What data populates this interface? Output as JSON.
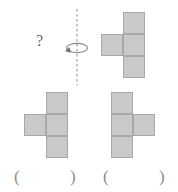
{
  "puzzle": {
    "type": "mental-rotation-spatial-reasoning",
    "unknown_marker": "?",
    "axis_label": "rotation-axis-dashed-vertical",
    "rotation_direction": "counterclockwise-about-vertical-axis"
  },
  "colors": {
    "background": "#ffffff",
    "cell_fill": "#c9c9c9",
    "cell_stroke": "#a8a8a8",
    "line": "#8c8c8c",
    "text": "#6e6e6e"
  },
  "shapes": {
    "prompt": {
      "name": "top-right-shape",
      "description": "vertical column of three squares with one square attached on the left of the middle square",
      "cells": [
        [
          1,
          0
        ],
        [
          1,
          1
        ],
        [
          1,
          2
        ],
        [
          0,
          1
        ]
      ],
      "grid_cols": 2,
      "grid_rows": 3
    },
    "option_a": {
      "name": "bottom-left-shape",
      "description": "vertical column of three squares with one square attached on the left of the middle square",
      "cells": [
        [
          1,
          0
        ],
        [
          1,
          1
        ],
        [
          1,
          2
        ],
        [
          0,
          1
        ]
      ],
      "grid_cols": 2,
      "grid_rows": 3
    },
    "option_b": {
      "name": "bottom-right-shape",
      "description": "vertical column of three squares with one square attached on the right of the middle square",
      "cells": [
        [
          0,
          0
        ],
        [
          0,
          1
        ],
        [
          0,
          2
        ],
        [
          1,
          1
        ]
      ],
      "grid_cols": 2,
      "grid_rows": 3
    }
  },
  "answer_blanks": [
    {
      "id": "blank-1",
      "open": "(",
      "close": ")",
      "value": ""
    },
    {
      "id": "blank-2",
      "open": "(",
      "close": ")",
      "value": ""
    }
  ]
}
